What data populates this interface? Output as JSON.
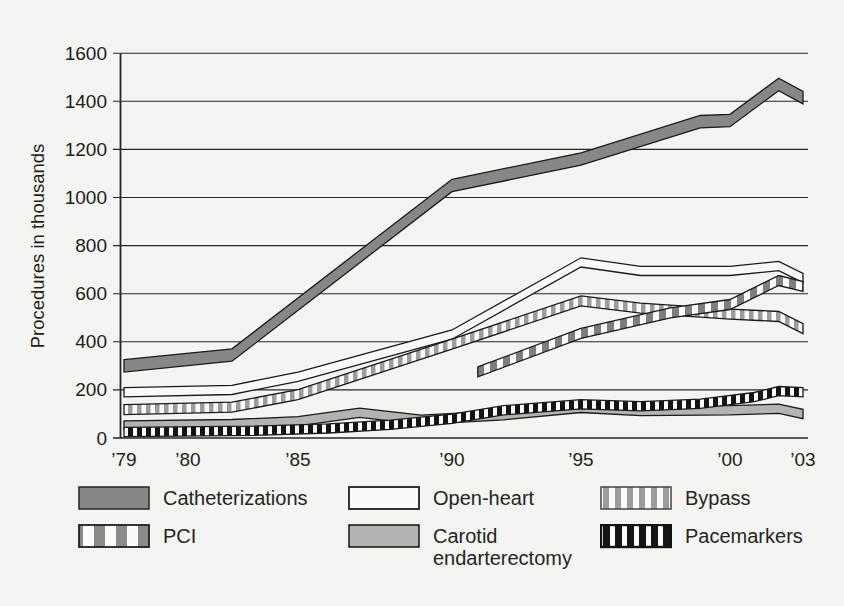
{
  "page": {
    "background": "#f4f4f1"
  },
  "chart_data": {
    "type": "line",
    "subtype": "layered-ribbon-bands",
    "title": "",
    "xlabel": "",
    "ylabel": "Procedures in thousands",
    "ylim": [
      0,
      1600
    ],
    "xlim_years": [
      1979,
      2003
    ],
    "grid": true,
    "legend_position": "bottom",
    "y_ticks": [
      0,
      200,
      400,
      600,
      800,
      1000,
      1200,
      1400,
      1600
    ],
    "x_ticks": [
      {
        "year": 1979,
        "label": "’79"
      },
      {
        "year": 1980,
        "label": "’80"
      },
      {
        "year": 1985,
        "label": "’85"
      },
      {
        "year": 1990,
        "label": "’90"
      },
      {
        "year": 1995,
        "label": "’95"
      },
      {
        "year": 2000,
        "label": "’00"
      },
      {
        "year": 2003,
        "label": "’03"
      }
    ],
    "series": [
      {
        "name": "Catheterizations",
        "pattern": "solid-dark-gray",
        "points": [
          [
            1979,
            300
          ],
          [
            1982,
            345
          ],
          [
            1990,
            1050
          ],
          [
            1995,
            1160
          ],
          [
            1999,
            1315
          ],
          [
            2000,
            1320
          ],
          [
            2002,
            1470
          ],
          [
            2003,
            1415
          ]
        ]
      },
      {
        "name": "Open-heart",
        "pattern": "solid-white",
        "points": [
          [
            1979,
            190
          ],
          [
            1982,
            200
          ],
          [
            1985,
            255
          ],
          [
            1990,
            430
          ],
          [
            1995,
            730
          ],
          [
            1997,
            695
          ],
          [
            2000,
            695
          ],
          [
            2002,
            715
          ],
          [
            2003,
            665
          ]
        ]
      },
      {
        "name": "Bypass",
        "pattern": "gray-vertical-stripes",
        "points": [
          [
            1979,
            118
          ],
          [
            1982,
            128
          ],
          [
            1985,
            180
          ],
          [
            1990,
            390
          ],
          [
            1995,
            570
          ],
          [
            1997,
            540
          ],
          [
            2000,
            515
          ],
          [
            2002,
            505
          ],
          [
            2003,
            455
          ]
        ]
      },
      {
        "name": "PCI",
        "pattern": "white-stripes-on-dark",
        "points": [
          [
            1991,
            275
          ],
          [
            1995,
            435
          ],
          [
            1998,
            520
          ],
          [
            2000,
            555
          ],
          [
            2002,
            655
          ],
          [
            2003,
            630
          ]
        ]
      },
      {
        "name": "Carotid endarterectomy",
        "pattern": "solid-medium-gray",
        "points": [
          [
            1979,
            52
          ],
          [
            1982,
            58
          ],
          [
            1985,
            70
          ],
          [
            1987,
            105
          ],
          [
            1989,
            76
          ],
          [
            1992,
            95
          ],
          [
            1995,
            125
          ],
          [
            1997,
            112
          ],
          [
            2000,
            115
          ],
          [
            2002,
            122
          ],
          [
            2003,
            100
          ]
        ]
      },
      {
        "name": "Pacemarkers",
        "pattern": "black-vertical-stripes",
        "points": [
          [
            1979,
            25
          ],
          [
            1983,
            30
          ],
          [
            1986,
            40
          ],
          [
            1988,
            55
          ],
          [
            1990,
            80
          ],
          [
            1992,
            115
          ],
          [
            1995,
            140
          ],
          [
            1997,
            132
          ],
          [
            1999,
            142
          ],
          [
            2001,
            170
          ],
          [
            2002,
            195
          ],
          [
            2003,
            190
          ]
        ]
      }
    ],
    "colors": {
      "dark_gray": "#878787",
      "medium_gray": "#b3b3b3",
      "stripe_gray": "#9c9c9c",
      "stripe_black": "#141414",
      "band_white": "#f9f9f6",
      "outline": "#1a1a1a",
      "axis": "#262626",
      "background": "#f4f4f1"
    }
  },
  "legend": {
    "items": [
      {
        "label": "Catheterizations",
        "swatch": "solid-dark-gray"
      },
      {
        "label": "Open-heart",
        "swatch": "solid-white"
      },
      {
        "label": "Bypass",
        "swatch": "gray-vertical-stripes"
      },
      {
        "label": "PCI",
        "swatch": "white-stripes-on-dark"
      },
      {
        "label": "Carotid endarterectomy",
        "swatch": "solid-medium-gray"
      },
      {
        "label": "Pacemarkers",
        "swatch": "black-vertical-stripes"
      }
    ]
  }
}
